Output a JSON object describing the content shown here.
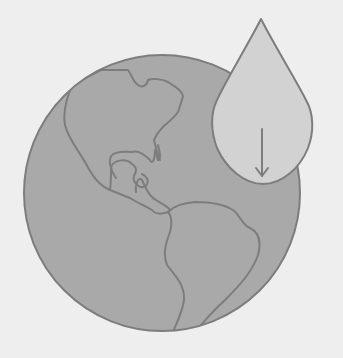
{
  "illustration": {
    "title": "Globe with water drop and down arrow",
    "icons": [
      "globe-icon",
      "water-drop-icon",
      "arrow-down-icon"
    ],
    "colors": {
      "background": "#eeeeee",
      "globe_fill": "#a9a9a9",
      "outline": "#7d7d7d",
      "drop_fill": "#d2d2d2"
    }
  }
}
